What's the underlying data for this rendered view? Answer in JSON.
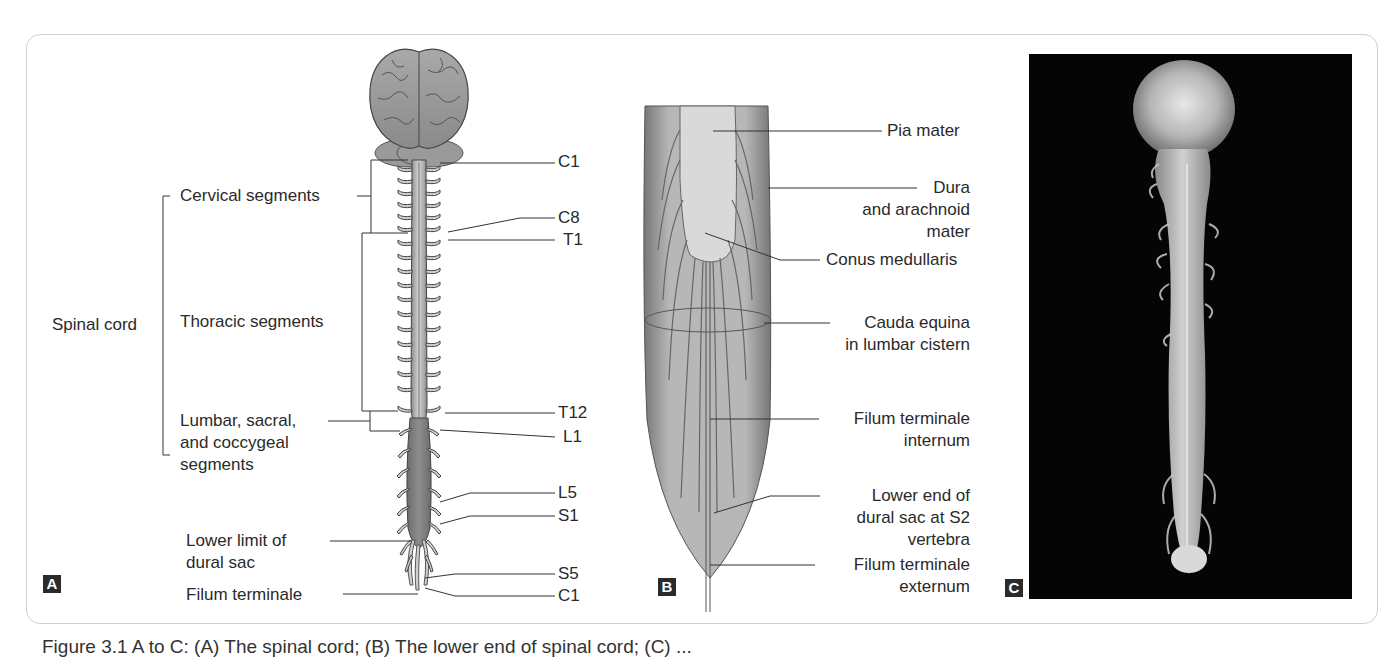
{
  "figure": {
    "caption": "Figure 3.1 A to C: (A) The spinal cord; (B) The lower end of spinal cord; (C) ...",
    "panels": {
      "A": {
        "tag": "A",
        "labels_left": {
          "spinal_cord": "Spinal cord",
          "cervical": "Cervical segments",
          "thoracic": "Thoracic segments",
          "lumbar_1": "Lumbar, sacral,",
          "lumbar_2": "and coccygeal",
          "lumbar_3": "segments",
          "lower_limit_1": "Lower limit of",
          "lower_limit_2": "dural sac",
          "filum": "Filum terminale"
        },
        "labels_right": [
          "C1",
          "C8",
          "T1",
          "T12",
          "L1",
          "L5",
          "S1",
          "S5",
          "C1"
        ]
      },
      "B": {
        "tag": "B",
        "labels": {
          "pia": "Pia mater",
          "dura_1": "Dura",
          "dura_2": "and arachnoid",
          "dura_3": "mater",
          "conus": "Conus medullaris",
          "cauda_1": "Cauda equina",
          "cauda_2": "in lumbar cistern",
          "fti_1": "Filum terminale",
          "fti_2": "internum",
          "lower_1": "Lower end of",
          "lower_2": "dural sac at S2",
          "lower_3": "vertebra",
          "fte_1": "Filum terminale",
          "fte_2": "externum"
        }
      },
      "C": {
        "tag": "C",
        "image": "dissected-brain-and-spinal-cord-photo"
      }
    }
  }
}
